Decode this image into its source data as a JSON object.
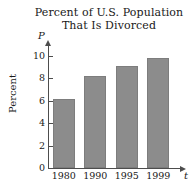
{
  "chart_data": {
    "type": "bar",
    "title": "Percent of U.S. Population That Is Divorced",
    "title_lines": [
      "Percent of U.S. Population",
      "That Is Divorced"
    ],
    "categories": [
      "1980",
      "1990",
      "1995",
      "1999"
    ],
    "values": [
      6.2,
      8.2,
      9.1,
      9.8
    ],
    "xlabel": "t",
    "ylabel": "Percent",
    "y_variable": "P",
    "x_variable": "t",
    "ylim": [
      0,
      11.2
    ],
    "yticks": [
      0,
      2,
      4,
      6,
      8,
      10
    ],
    "ytick_labels": [
      "0",
      "2",
      "4",
      "6",
      "8",
      "10"
    ],
    "grid": false,
    "legend": null,
    "bar_color": "#8c8c8c",
    "axis_color": "#4d4d4d",
    "background_color": "#ffffff"
  }
}
